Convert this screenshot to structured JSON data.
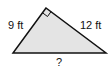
{
  "figure": {
    "type": "right-triangle",
    "fill_color": "#e4e4e4",
    "stroke_color": "#111111",
    "labels": {
      "left_leg": "9 ft",
      "right_leg": "12 ft",
      "hypotenuse": "?"
    },
    "right_angle_marker": true
  }
}
